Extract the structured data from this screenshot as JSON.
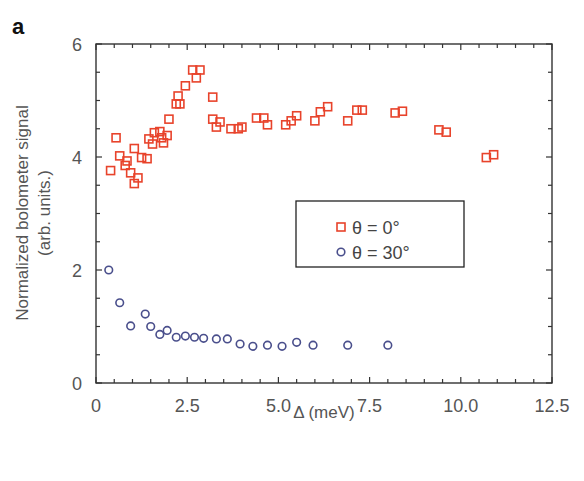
{
  "panel_label": "a",
  "colors": {
    "series_0": "#e8432b",
    "series_30": "#4a4f8c",
    "axis": "#333333"
  },
  "chart_data": {
    "type": "scatter",
    "title": "",
    "xlabel": "Δ (meV)",
    "ylabel": "Normalized bolometer signal (arb. units.)",
    "ylabel_lines": [
      "Normalized bolometer signal",
      "(arb. units.)"
    ],
    "xlim": [
      0,
      12.5
    ],
    "ylim": [
      0,
      6
    ],
    "xticks": [
      0,
      2.5,
      5.0,
      7.5,
      10.0,
      12.5
    ],
    "xtick_labels": [
      "0",
      "2.5",
      "5.0",
      "7.5",
      "10.0",
      "12.5"
    ],
    "yticks": [
      0,
      2,
      4,
      6
    ],
    "ytick_labels": [
      "0",
      "2",
      "4",
      "6"
    ],
    "grid": false,
    "legend_position": "center-right",
    "series": [
      {
        "name": "θ = 0°",
        "marker": "square",
        "color": "#e8432b",
        "x": [
          0.4,
          0.55,
          0.65,
          0.8,
          0.85,
          0.95,
          1.05,
          1.05,
          1.15,
          1.25,
          1.4,
          1.45,
          1.55,
          1.6,
          1.75,
          1.8,
          1.85,
          1.95,
          2.0,
          2.2,
          2.25,
          2.3,
          2.45,
          2.65,
          2.75,
          2.85,
          3.2,
          3.2,
          3.3,
          3.4,
          3.7,
          3.9,
          4.0,
          4.4,
          4.6,
          4.7,
          5.2,
          5.35,
          5.5,
          6.0,
          6.15,
          6.35,
          6.9,
          7.15,
          7.3,
          8.2,
          8.4,
          9.4,
          9.6,
          10.7,
          10.9
        ],
        "y": [
          3.76,
          4.34,
          4.02,
          3.85,
          3.93,
          3.72,
          4.15,
          3.53,
          3.63,
          3.99,
          3.97,
          4.32,
          4.23,
          4.43,
          4.45,
          4.34,
          4.25,
          4.38,
          4.67,
          4.94,
          5.08,
          4.94,
          5.26,
          5.54,
          5.4,
          5.54,
          5.06,
          4.67,
          4.53,
          4.62,
          4.5,
          4.5,
          4.53,
          4.69,
          4.69,
          4.57,
          4.57,
          4.64,
          4.73,
          4.64,
          4.8,
          4.89,
          4.64,
          4.83,
          4.83,
          4.78,
          4.81,
          4.48,
          4.44,
          3.99,
          4.04
        ]
      },
      {
        "name": "θ = 30°",
        "marker": "circle",
        "color": "#4a4f8c",
        "x": [
          0.35,
          0.65,
          0.95,
          1.35,
          1.5,
          1.75,
          1.95,
          2.2,
          2.45,
          2.7,
          2.95,
          3.3,
          3.6,
          3.95,
          4.3,
          4.7,
          5.1,
          5.5,
          5.95,
          6.9,
          8.0
        ],
        "y": [
          2.0,
          1.42,
          1.01,
          1.22,
          1.0,
          0.86,
          0.93,
          0.81,
          0.83,
          0.81,
          0.79,
          0.78,
          0.78,
          0.69,
          0.65,
          0.67,
          0.65,
          0.72,
          0.67,
          0.67,
          0.67
        ]
      }
    ]
  }
}
